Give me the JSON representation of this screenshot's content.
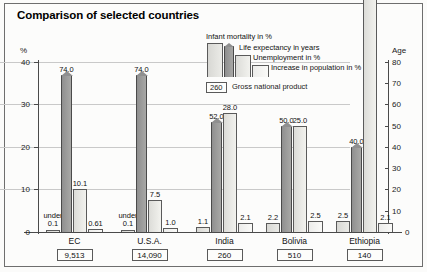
{
  "chart_data": {
    "type": "bar",
    "title": "Comparison of selected countries",
    "categories": [
      "EC",
      "U.S.A.",
      "India",
      "Bolivia",
      "Ethiopia"
    ],
    "series": [
      {
        "name": "Infant mortality in %",
        "values": [
          0.1,
          0.1,
          1.1,
          2.2,
          2.5
        ],
        "labels": [
          "under 0.1",
          "under 0.1",
          "1.1",
          "2.2",
          "2.5"
        ],
        "axis": "left"
      },
      {
        "name": "Life expectancy in years",
        "values": [
          74.0,
          74.0,
          52.0,
          50.0,
          40.0
        ],
        "labels": [
          "74.0",
          "74.0",
          "52.0",
          "50.0",
          "40.0"
        ],
        "axis": "right"
      },
      {
        "name": "Unemployment in %",
        "values": [
          10.1,
          7.5,
          28.0,
          25.0,
          80.0
        ],
        "labels": [
          "10.1",
          "7.5",
          "28.0",
          "25.0",
          "80.0"
        ],
        "axis": "left"
      },
      {
        "name": "Increase in population in %",
        "values": [
          0.61,
          1.0,
          2.1,
          2.5,
          2.1
        ],
        "labels": [
          "0.61",
          "1.0",
          "2.1",
          "2.5",
          "2.1"
        ],
        "axis": "left"
      }
    ],
    "gross_national_product": {
      "legend_label": "Gross national product",
      "legend_swatch_value": "260",
      "values": [
        "9,513",
        "14,090",
        "260",
        "510",
        "140"
      ]
    },
    "xlabel": "",
    "ylabel": "%",
    "y2label": "Age",
    "ylim": [
      0,
      40
    ],
    "y2lim": [
      0,
      80
    ],
    "yticks": [
      "0",
      "10",
      "20",
      "30",
      "40"
    ],
    "y2ticks": [
      "0",
      "10",
      "20",
      "30",
      "40",
      "50",
      "60",
      "70",
      "80"
    ],
    "grid": true,
    "legend_position": "top-center"
  },
  "axes": {
    "left_unit": "%",
    "right_unit": "Age",
    "left_ticks": [
      "40",
      "30",
      "20",
      "10",
      "0"
    ],
    "right_ticks": [
      "80",
      "70",
      "60",
      "50",
      "40",
      "30",
      "20",
      "10",
      "0"
    ]
  }
}
